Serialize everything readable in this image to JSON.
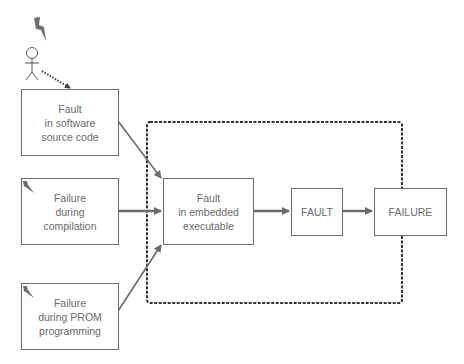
{
  "diagram": {
    "boundary": {
      "label": "",
      "style": "dashed"
    },
    "nodes": [
      {
        "id": "src",
        "lines": [
          "Fault",
          "in software",
          "source code"
        ]
      },
      {
        "id": "comp",
        "lines": [
          "Failure",
          "during",
          "compilation"
        ]
      },
      {
        "id": "prom",
        "lines": [
          "Failure",
          "during PROM",
          "programming"
        ]
      },
      {
        "id": "emb",
        "lines": [
          "Fault",
          "in embedded",
          "executable"
        ]
      },
      {
        "id": "fault",
        "lines": [
          "FAULT"
        ]
      },
      {
        "id": "failure",
        "lines": [
          "FAILURE"
        ]
      }
    ],
    "edges": [
      {
        "from": "human",
        "to": "src",
        "style": "dotted"
      },
      {
        "from": "src",
        "to": "emb"
      },
      {
        "from": "comp",
        "to": "emb"
      },
      {
        "from": "prom",
        "to": "emb"
      },
      {
        "from": "emb",
        "to": "fault"
      },
      {
        "from": "fault",
        "to": "failure"
      }
    ],
    "icons": [
      "lightning-icon",
      "stick-figure-icon"
    ],
    "colors": {
      "line": "#6b6b6b",
      "dashed": "#333333",
      "text": "#6a6a6a"
    }
  }
}
